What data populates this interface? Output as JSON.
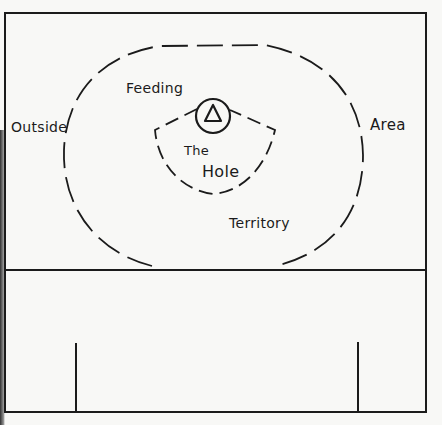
{
  "diagram": {
    "labels": {
      "outside": "Outside",
      "feeding": "Feeding",
      "area": "Area",
      "territory": "Territory",
      "the": "The",
      "hole": "Hole"
    },
    "symbol": "triangle-in-circle",
    "colors": {
      "ink": "#1b1b1b",
      "paper": "#f8f8f6"
    }
  }
}
